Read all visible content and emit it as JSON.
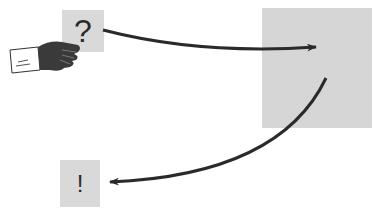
{
  "diagram": {
    "input_symbol": "?",
    "output_symbol": "!",
    "colors": {
      "box_fill": "#d9d9d9",
      "arrow": "#2a2a2a",
      "hand": "#3a3a3a",
      "cuff": "#ffffff"
    },
    "elements": [
      {
        "id": "question-box",
        "label": "?"
      },
      {
        "id": "black-box",
        "label": ""
      },
      {
        "id": "answer-box",
        "label": "!"
      }
    ],
    "arrows": [
      {
        "from": "question-box",
        "to": "black-box"
      },
      {
        "from": "black-box",
        "to": "answer-box"
      }
    ]
  }
}
